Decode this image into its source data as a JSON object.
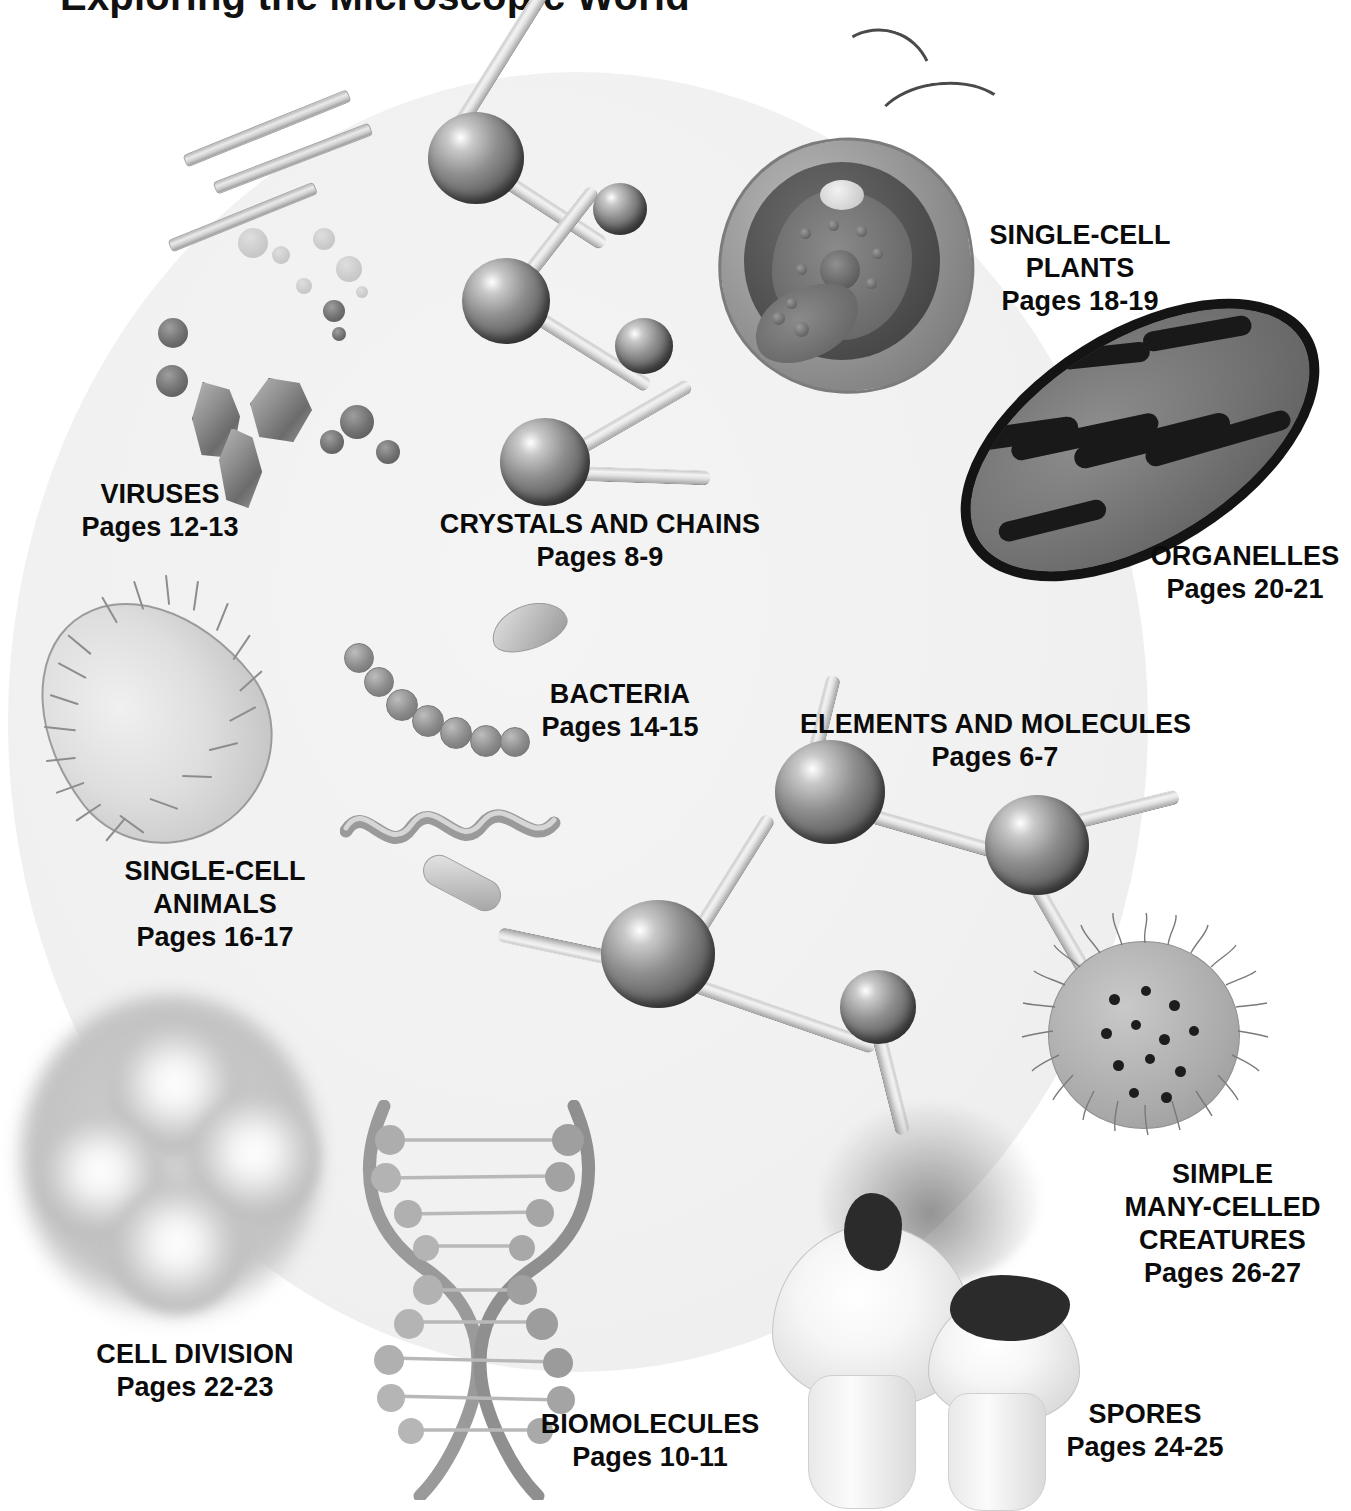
{
  "page": {
    "title": "Exploring the Microscopic World",
    "kind": "illustrated-contents-map",
    "background_circle_color": "#f1f1f1",
    "ink_color": "#000000",
    "width": 1351,
    "height": 1510
  },
  "entries": [
    {
      "id": "viruses",
      "title": "VIRUSES",
      "title_line2": "",
      "title_line3": "",
      "pages": "Pages 12-13",
      "icon": "virus-crystals-icon"
    },
    {
      "id": "crystals",
      "title": "CRYSTALS AND CHAINS",
      "title_line2": "",
      "title_line3": "",
      "pages": "Pages 8-9",
      "icon": "molecule-chain-icon"
    },
    {
      "id": "single-plants",
      "title": "SINGLE-CELL",
      "title_line2": "PLANTS",
      "title_line3": "",
      "pages": "Pages 18-19",
      "icon": "algae-cell-icon"
    },
    {
      "id": "organelles",
      "title": "ORGANELLES",
      "title_line2": "",
      "title_line3": "",
      "pages": "Pages 20-21",
      "icon": "mitochondrion-icon"
    },
    {
      "id": "bacteria",
      "title": "BACTERIA",
      "title_line2": "",
      "title_line3": "",
      "pages": "Pages 14-15",
      "icon": "bacteria-icon"
    },
    {
      "id": "elements",
      "title": "ELEMENTS AND MOLECULES",
      "title_line2": "",
      "title_line3": "",
      "pages": "Pages 6-7",
      "icon": "ball-and-stick-icon"
    },
    {
      "id": "single-animals",
      "title": "SINGLE-CELL",
      "title_line2": "ANIMALS",
      "title_line3": "",
      "pages": "Pages 16-17",
      "icon": "paramecium-icon"
    },
    {
      "id": "many-celled",
      "title": "SIMPLE",
      "title_line2": "MANY-CELLED",
      "title_line3": "CREATURES",
      "pages": "Pages 26-27",
      "icon": "volvox-icon"
    },
    {
      "id": "cell-division",
      "title": "CELL DIVISION",
      "title_line2": "",
      "title_line3": "",
      "pages": "Pages 22-23",
      "icon": "four-cell-icon"
    },
    {
      "id": "biomolecules",
      "title": "BIOMOLECULES",
      "title_line2": "",
      "title_line3": "",
      "pages": "Pages 10-11",
      "icon": "dna-helix-icon"
    },
    {
      "id": "spores",
      "title": "SPORES",
      "title_line2": "",
      "title_line3": "",
      "pages": "Pages 24-25",
      "icon": "puffball-icon"
    }
  ]
}
